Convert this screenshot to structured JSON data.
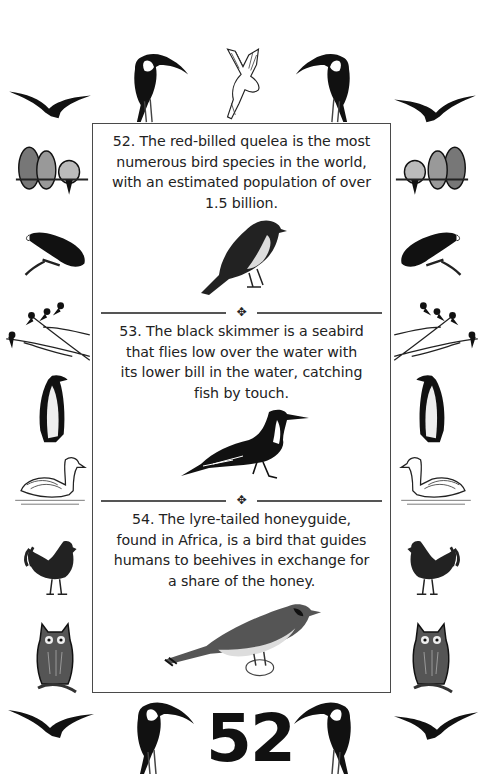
{
  "page": {
    "page_number": "52",
    "background_color": "#ffffff",
    "border_color": "#4a4a4a",
    "text_color": "#222222"
  },
  "facts": [
    {
      "number": "52",
      "lines": [
        "52. The red-billed quelea is the most",
        "numerous bird species in the world,",
        "with an estimated population of over",
        "1.5 billion."
      ],
      "illustration": "red-billed-quelea-illustration"
    },
    {
      "number": "53",
      "lines": [
        "53. The black skimmer is a seabird",
        "that flies low over the water with",
        "its lower bill in the water, catching",
        "fish by touch."
      ],
      "illustration": "black-skimmer-illustration"
    },
    {
      "number": "54",
      "lines": [
        "54. The lyre-tailed honeyguide,",
        "found in Africa, is a bird that guides",
        "humans to beehives in exchange for",
        "a share of the honey."
      ],
      "illustration": "honeyguide-illustration"
    }
  ],
  "dividers": {
    "ornament": "✥"
  },
  "border_birds": {
    "top": [
      "seagull-silhouette",
      "toucan",
      "dove",
      "toucan",
      "seagull-silhouette"
    ],
    "left": [
      "lovebirds",
      "parrot",
      "birds-on-branch",
      "penguin",
      "swan",
      "rooster",
      "owl"
    ],
    "right": [
      "lovebirds",
      "parrot",
      "birds-on-branch",
      "penguin",
      "swan",
      "rooster",
      "owl"
    ],
    "bottom": [
      "seagull-silhouette",
      "toucan",
      "toucan",
      "seagull-silhouette"
    ]
  }
}
